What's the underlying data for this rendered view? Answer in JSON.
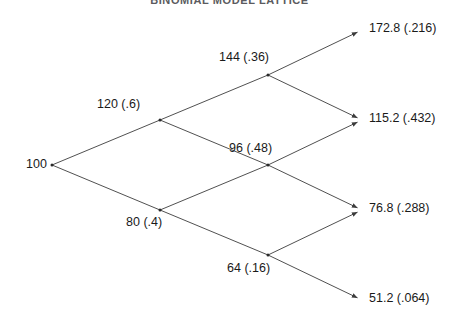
{
  "figure": {
    "title": "BINOMIAL MODEL LATTICE",
    "width": 459,
    "height": 330,
    "background_color": "#ffffff",
    "line_color": "#3c3c3c",
    "text_color": "#1a1a1a",
    "margin_rule_color": "#8a8a8a"
  },
  "chart_data": {
    "type": "diagram",
    "diagram_kind": "binomial-lattice",
    "title": "BINOMIAL MODEL LATTICE",
    "periods": 3,
    "up_factor": 1.2,
    "down_factor": 0.8,
    "root_value": 100,
    "nodes": [
      {
        "id": "n0",
        "step": 0,
        "ups": 0,
        "value": "100",
        "probability": "",
        "label": "100",
        "x": 52,
        "y": 165,
        "label_x": 26,
        "label_y": 158,
        "terminal": false,
        "has_dot": true
      },
      {
        "id": "n1u",
        "step": 1,
        "ups": 1,
        "value": "120",
        "probability": ".6",
        "label": "120 (.6)",
        "x": 160,
        "y": 120,
        "label_x": 97,
        "label_y": 98,
        "terminal": false,
        "has_dot": true
      },
      {
        "id": "n1d",
        "step": 1,
        "ups": 0,
        "value": "80",
        "probability": ".4",
        "label": "80 (.4)",
        "x": 160,
        "y": 210,
        "label_x": 126,
        "label_y": 216,
        "terminal": false,
        "has_dot": true
      },
      {
        "id": "n2uu",
        "step": 2,
        "ups": 2,
        "value": "144",
        "probability": ".36",
        "label": "144 (.36)",
        "x": 268,
        "y": 75,
        "label_x": 219,
        "label_y": 51,
        "terminal": false,
        "has_dot": true
      },
      {
        "id": "n2ud",
        "step": 2,
        "ups": 1,
        "value": "96",
        "probability": ".48",
        "label": "96 (.48)",
        "x": 268,
        "y": 165,
        "label_x": 229,
        "label_y": 142,
        "terminal": false,
        "has_dot": true
      },
      {
        "id": "n2dd",
        "step": 2,
        "ups": 0,
        "value": "64",
        "probability": ".16",
        "label": "64 (.16)",
        "x": 268,
        "y": 255,
        "label_x": 227,
        "label_y": 262,
        "terminal": false,
        "has_dot": true
      },
      {
        "id": "n3a",
        "step": 3,
        "ups": 3,
        "value": "172.8",
        "probability": ".216",
        "label": "172.8 (.216)",
        "x": 362,
        "y": 30,
        "label_x": 369,
        "label_y": 22,
        "terminal": true,
        "has_dot": false
      },
      {
        "id": "n3b",
        "step": 3,
        "ups": 2,
        "value": "115.2",
        "probability": ".432",
        "label": "115.2 (.432)",
        "x": 362,
        "y": 120,
        "label_x": 369,
        "label_y": 112,
        "terminal": true,
        "has_dot": false
      },
      {
        "id": "n3c",
        "step": 3,
        "ups": 1,
        "value": "76.8",
        "probability": ".288",
        "label": "76.8 (.288)",
        "x": 362,
        "y": 210,
        "label_x": 369,
        "label_y": 202,
        "terminal": true,
        "has_dot": false
      },
      {
        "id": "n3d",
        "step": 3,
        "ups": 0,
        "value": "51.2",
        "probability": ".064",
        "label": "51.2 (.064)",
        "x": 362,
        "y": 300,
        "label_x": 369,
        "label_y": 292,
        "terminal": true,
        "has_dot": false
      }
    ],
    "edges": [
      {
        "from": "n0",
        "to": "n1u",
        "direction": "up",
        "arrow": false
      },
      {
        "from": "n0",
        "to": "n1d",
        "direction": "down",
        "arrow": false
      },
      {
        "from": "n1u",
        "to": "n2uu",
        "direction": "up",
        "arrow": false
      },
      {
        "from": "n1u",
        "to": "n2ud",
        "direction": "down",
        "arrow": false
      },
      {
        "from": "n1d",
        "to": "n2ud",
        "direction": "up",
        "arrow": false
      },
      {
        "from": "n1d",
        "to": "n2dd",
        "direction": "down",
        "arrow": false
      },
      {
        "from": "n2uu",
        "to": "n3a",
        "direction": "up",
        "arrow": true
      },
      {
        "from": "n2uu",
        "to": "n3b",
        "direction": "down",
        "arrow": true
      },
      {
        "from": "n2ud",
        "to": "n3b",
        "direction": "up",
        "arrow": true
      },
      {
        "from": "n2ud",
        "to": "n3c",
        "direction": "down",
        "arrow": true
      },
      {
        "from": "n2dd",
        "to": "n3c",
        "direction": "up",
        "arrow": true
      },
      {
        "from": "n2dd",
        "to": "n3d",
        "direction": "down",
        "arrow": true
      }
    ],
    "margin_rule": {
      "x": 21.5,
      "y_top": 18,
      "y_bottom": 320
    }
  }
}
